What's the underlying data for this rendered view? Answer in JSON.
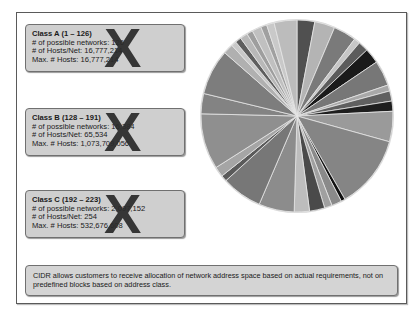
{
  "classes": [
    {
      "title": "Class A (1 – 126)",
      "networks": "# of possible networks: 126",
      "hosts_per_net": "# of Hosts/Net: 16,777,214",
      "max_hosts": "Max. # Hosts: 16,777,214",
      "mark": "X"
    },
    {
      "title": "Class B  (128 – 191)",
      "networks": "# of possible networks: 16,384",
      "hosts_per_net": "# of Hosts/Net: 65,534",
      "max_hosts": "Max. # Hosts: 1,073,709,056",
      "mark": "X"
    },
    {
      "title": "Class C (192 – 223)",
      "networks": "# of possible networks: 2,097,152",
      "hosts_per_net": "# of Hosts/Net: 254",
      "max_hosts": "Max. # Hosts: 532,676,608",
      "mark": "X"
    }
  ],
  "cidr_note": "CIDR allows customers to receive allocation of network address space based on actual requirements, not on predefined blocks based on address class.",
  "caption": "",
  "chart_data": {
    "type": "pie",
    "title": "",
    "note": "Unlabeled grayscale pie showing many variable-size allocations; slice shares estimated as fractions of the full circle, listed clockwise from 12 o'clock.",
    "slices": [
      {
        "share": 0.035,
        "color": "#505050"
      },
      {
        "share": 0.04,
        "color": "#b4b4b4"
      },
      {
        "share": 0.045,
        "color": "#7a7a7a"
      },
      {
        "share": 0.012,
        "color": "#c6c6c6"
      },
      {
        "share": 0.02,
        "color": "#5c5c5c"
      },
      {
        "share": 0.03,
        "color": "#1a1a1a"
      },
      {
        "share": 0.05,
        "color": "#777777"
      },
      {
        "share": 0.012,
        "color": "#a8a8a8"
      },
      {
        "share": 0.02,
        "color": "#606060"
      },
      {
        "share": 0.02,
        "color": "#1e1e1e"
      },
      {
        "share": 0.06,
        "color": "#9a9a9a"
      },
      {
        "share": 0.145,
        "color": "#858585"
      },
      {
        "share": 0.008,
        "color": "#111111"
      },
      {
        "share": 0.02,
        "color": "#8a8a8a"
      },
      {
        "share": 0.015,
        "color": "#a0a0a0"
      },
      {
        "share": 0.03,
        "color": "#4a4a4a"
      },
      {
        "share": 0.03,
        "color": "#bdbdbd"
      },
      {
        "share": 0.07,
        "color": "#8c8c8c"
      },
      {
        "share": 0.08,
        "color": "#777777"
      },
      {
        "share": 0.012,
        "color": "#5a5a5a"
      },
      {
        "share": 0.02,
        "color": "#a5a5a5"
      },
      {
        "share": 0.11,
        "color": "#8f8f8f"
      },
      {
        "share": 0.04,
        "color": "#838383"
      },
      {
        "share": 0.09,
        "color": "#7d7d7d"
      },
      {
        "share": 0.02,
        "color": "#b0b0b0"
      },
      {
        "share": 0.01,
        "color": "#c8c8c8"
      },
      {
        "share": 0.012,
        "color": "#5e5e5e"
      },
      {
        "share": 0.015,
        "color": "#b8b8b8"
      },
      {
        "share": 0.012,
        "color": "#9e9e9e"
      },
      {
        "share": 0.018,
        "color": "#c0c0c0"
      },
      {
        "share": 0.012,
        "color": "#a0a0a0"
      },
      {
        "share": 0.015,
        "color": "#c9c9c9"
      },
      {
        "share": 0.045,
        "color": "#bcbcbc"
      }
    ]
  }
}
